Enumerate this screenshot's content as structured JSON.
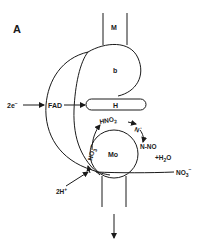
{
  "figure": {
    "panel_label": "A",
    "domains": {
      "membrane_anchor": "M",
      "heme": "b",
      "hinge": "H",
      "molybdenum": "Mo"
    },
    "inputs": {
      "electrons": "2e",
      "electrons_sup": "−",
      "cofactor": "FAD",
      "protons": "2H",
      "protons_sup": "+"
    },
    "reaction": {
      "nitrate_in": "NO",
      "nitrate_in_sub": "3",
      "nitrate_in_sup": "−",
      "nitrate_bound": "NO",
      "nitrate_bound_sub": "3",
      "nitrate_bound_sup": "−",
      "nitrous_acid": "HNO",
      "nitrous_acid_sub": "2",
      "nitrogen_radical": "N",
      "nitrogen_radical_sup": "·",
      "nitroso": "N-NO",
      "water": "+H",
      "water_sub": "2",
      "water_tail": "O"
    },
    "colors": {
      "ink": "#1a1a1a",
      "background": "#ffffff"
    }
  }
}
